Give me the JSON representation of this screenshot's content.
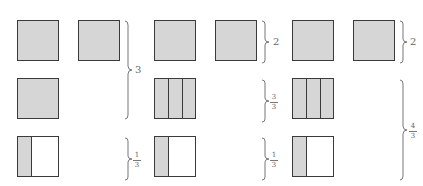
{
  "diagram": {
    "colors": {
      "fill": "#d6d6d6",
      "stroke": "#3a3a3a",
      "label": "#666666"
    },
    "groups": [
      {
        "name": "group-1",
        "squares": [
          {
            "row": 1,
            "col": 1,
            "type": "whole"
          },
          {
            "row": 1,
            "col": 2,
            "type": "whole"
          },
          {
            "row": 2,
            "col": 1,
            "type": "whole"
          },
          {
            "row": 3,
            "col": 1,
            "type": "one-third"
          }
        ],
        "braces": [
          {
            "label": "3",
            "spans": "rows 1-2"
          },
          {
            "label_numerator": "1",
            "label_denominator": "3",
            "spans": "row 3"
          }
        ]
      },
      {
        "name": "group-2",
        "squares": [
          {
            "row": 1,
            "col": 1,
            "type": "whole"
          },
          {
            "row": 1,
            "col": 2,
            "type": "whole"
          },
          {
            "row": 2,
            "col": 1,
            "type": "three-thirds"
          },
          {
            "row": 3,
            "col": 1,
            "type": "one-third"
          }
        ],
        "braces": [
          {
            "label": "2",
            "spans": "row 1"
          },
          {
            "label_numerator": "3",
            "label_denominator": "3",
            "spans": "row 2"
          },
          {
            "label_numerator": "1",
            "label_denominator": "3",
            "spans": "row 3"
          }
        ]
      },
      {
        "name": "group-3",
        "squares": [
          {
            "row": 1,
            "col": 1,
            "type": "whole"
          },
          {
            "row": 1,
            "col": 2,
            "type": "whole"
          },
          {
            "row": 2,
            "col": 1,
            "type": "three-thirds"
          },
          {
            "row": 3,
            "col": 1,
            "type": "one-third"
          }
        ],
        "braces": [
          {
            "label": "2",
            "spans": "row 1"
          },
          {
            "label_numerator": "4",
            "label_denominator": "3",
            "spans": "rows 2-3"
          }
        ]
      }
    ]
  },
  "labels": {
    "g1_top": "3",
    "g1_bottom_num": "1",
    "g1_bottom_den": "3",
    "g2_top": "2",
    "g2_mid_num": "3",
    "g2_mid_den": "3",
    "g2_bottom_num": "1",
    "g2_bottom_den": "3",
    "g3_top": "2",
    "g3_bottom_num": "4",
    "g3_bottom_den": "3"
  }
}
